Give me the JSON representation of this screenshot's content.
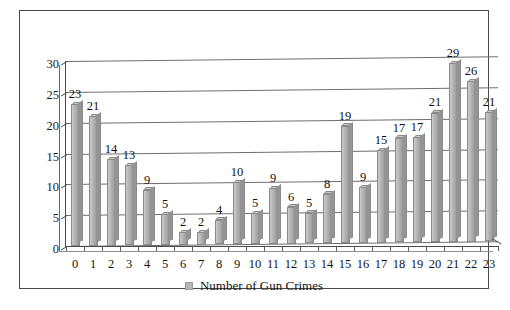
{
  "chart_data": {
    "type": "bar",
    "title": "",
    "xlabel": "",
    "ylabel": "",
    "categories": [
      "0",
      "1",
      "2",
      "3",
      "4",
      "5",
      "6",
      "7",
      "8",
      "9",
      "10",
      "11",
      "12",
      "13",
      "14",
      "15",
      "16",
      "17",
      "18",
      "19",
      "20",
      "21",
      "22",
      "23"
    ],
    "values": [
      23,
      21,
      14,
      13,
      9,
      5,
      2,
      2,
      4,
      10,
      5,
      9,
      6,
      5,
      8,
      19,
      9,
      15,
      17,
      17,
      21,
      29,
      26,
      21
    ],
    "series": [
      {
        "name": "Number of Gun Crimes",
        "values": [
          23,
          21,
          14,
          13,
          9,
          5,
          2,
          2,
          4,
          10,
          5,
          9,
          6,
          5,
          8,
          19,
          9,
          15,
          17,
          17,
          21,
          29,
          26,
          21
        ]
      }
    ],
    "ylim": [
      0,
      30
    ],
    "ytick_labels": [
      "0",
      "5",
      "10",
      "15",
      "20",
      "25",
      "30"
    ],
    "ytick_values": [
      0,
      5,
      10,
      15,
      20,
      25,
      30
    ],
    "grid": true,
    "data_labels": true,
    "legend": {
      "position": "bottom",
      "entries": [
        {
          "label": "Number of Gun Crimes",
          "color": "#b6b6b6"
        }
      ]
    },
    "colors": {
      "bar_fill": "#b3b3b3",
      "bar_border": "#8a8a8a",
      "gridline": "#6d6d6d",
      "axis": "#4b4b4b",
      "text": "#131313",
      "frame_border": "#4a4a4a",
      "background": "#ffffff"
    }
  }
}
